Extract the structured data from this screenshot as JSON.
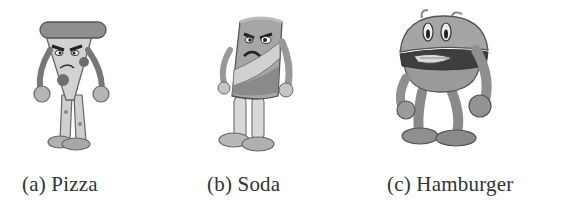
{
  "figure": {
    "subfigures": [
      {
        "label": "(a)",
        "name": "Pizza",
        "caption": "(a) Pizza",
        "character": "pizza-character"
      },
      {
        "label": "(b)",
        "name": "Soda",
        "caption": "(b) Soda",
        "character": "soda-character"
      },
      {
        "label": "(c)",
        "name": "Hamburger",
        "caption": "(c) Hamburger",
        "character": "hamburger-character"
      }
    ],
    "colors": {
      "background": "#ffffff",
      "caption_text": "#333333",
      "outline": "#555555"
    }
  }
}
